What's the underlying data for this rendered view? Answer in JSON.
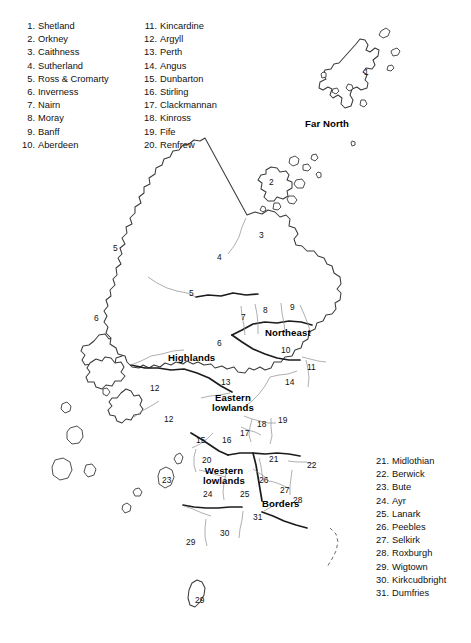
{
  "figure": {
    "background_color": "#ffffff",
    "outline_color": "#3a3a3a",
    "region_boundary_color": "#1a1a1a",
    "county_boundary_color": "#8c8c8c",
    "text_color": "#111111"
  },
  "legend": {
    "col1": [
      {
        "num": "1.",
        "name": "Shetland"
      },
      {
        "num": "2.",
        "name": "Orkney"
      },
      {
        "num": "3.",
        "name": "Caithness"
      },
      {
        "num": "4.",
        "name": "Sutherland"
      },
      {
        "num": "5.",
        "name": "Ross & Cromarty"
      },
      {
        "num": "6.",
        "name": "Inverness"
      },
      {
        "num": "7.",
        "name": "Nairn"
      },
      {
        "num": "8.",
        "name": "Moray"
      },
      {
        "num": "9.",
        "name": "Banff"
      },
      {
        "num": "10.",
        "name": "Aberdeen"
      }
    ],
    "col2": [
      {
        "num": "11.",
        "name": "Kincardine"
      },
      {
        "num": "12.",
        "name": "Argyll"
      },
      {
        "num": "13.",
        "name": "Perth"
      },
      {
        "num": "14.",
        "name": "Angus"
      },
      {
        "num": "15.",
        "name": "Dunbarton"
      },
      {
        "num": "16.",
        "name": "Stirling"
      },
      {
        "num": "17.",
        "name": "Clackmannan"
      },
      {
        "num": "18.",
        "name": "Kinross"
      },
      {
        "num": "19.",
        "name": "Fife"
      },
      {
        "num": "20.",
        "name": "Renfrew"
      }
    ],
    "col3": [
      {
        "num": "21.",
        "name": "Midlothian"
      },
      {
        "num": "22.",
        "name": "Berwick"
      },
      {
        "num": "23.",
        "name": "Bute"
      },
      {
        "num": "24.",
        "name": "Ayr"
      },
      {
        "num": "25.",
        "name": "Lanark"
      },
      {
        "num": "26.",
        "name": "Peebles"
      },
      {
        "num": "27.",
        "name": "Selkirk"
      },
      {
        "num": "28.",
        "name": "Roxburgh"
      },
      {
        "num": "29.",
        "name": "Wigtown"
      },
      {
        "num": "30.",
        "name": "Kirkcudbright"
      },
      {
        "num": "31.",
        "name": "Dumfries"
      }
    ]
  },
  "regions": [
    {
      "name": "Far North",
      "x": 305,
      "y": 118,
      "multiline": false
    },
    {
      "name": "Highlands",
      "x": 168,
      "y": 352,
      "multiline": false
    },
    {
      "name": "Northeast",
      "x": 265,
      "y": 327,
      "multiline": false
    },
    {
      "name": "Eastern\nlowlands",
      "x": 212,
      "y": 393,
      "multiline": true
    },
    {
      "name": "Western\nlowlands",
      "x": 203,
      "y": 466,
      "multiline": true
    },
    {
      "name": "Borders",
      "x": 262,
      "y": 498,
      "multiline": false
    }
  ],
  "county_markers": [
    {
      "num": "1",
      "x": 369,
      "y": 73
    },
    {
      "num": "2",
      "x": 274,
      "y": 183
    },
    {
      "num": "3",
      "x": 264,
      "y": 236
    },
    {
      "num": "4",
      "x": 222,
      "y": 258
    },
    {
      "num": "5",
      "x": 118,
      "y": 249
    },
    {
      "num": "5",
      "x": 194,
      "y": 294
    },
    {
      "num": "6",
      "x": 99,
      "y": 319
    },
    {
      "num": "6",
      "x": 222,
      "y": 344
    },
    {
      "num": "7",
      "x": 246,
      "y": 318
    },
    {
      "num": "8",
      "x": 268,
      "y": 311
    },
    {
      "num": "9",
      "x": 295,
      "y": 308
    },
    {
      "num": "10",
      "x": 286,
      "y": 351
    },
    {
      "num": "11",
      "x": 312,
      "y": 368
    },
    {
      "num": "12",
      "x": 155,
      "y": 389
    },
    {
      "num": "12",
      "x": 169,
      "y": 420
    },
    {
      "num": "13",
      "x": 226,
      "y": 383
    },
    {
      "num": "14",
      "x": 290,
      "y": 383
    },
    {
      "num": "15",
      "x": 201,
      "y": 441
    },
    {
      "num": "16",
      "x": 227,
      "y": 441
    },
    {
      "num": "17",
      "x": 245,
      "y": 434
    },
    {
      "num": "18",
      "x": 262,
      "y": 425
    },
    {
      "num": "19",
      "x": 283,
      "y": 421
    },
    {
      "num": "20",
      "x": 207,
      "y": 461
    },
    {
      "num": "21",
      "x": 274,
      "y": 460
    },
    {
      "num": "22",
      "x": 312,
      "y": 466
    },
    {
      "num": "23",
      "x": 167,
      "y": 481
    },
    {
      "num": "24",
      "x": 208,
      "y": 495
    },
    {
      "num": "25",
      "x": 245,
      "y": 495
    },
    {
      "num": "26",
      "x": 264,
      "y": 481
    },
    {
      "num": "27",
      "x": 285,
      "y": 491
    },
    {
      "num": "28",
      "x": 298,
      "y": 501
    },
    {
      "num": "29",
      "x": 191,
      "y": 543
    },
    {
      "num": "29",
      "x": 200,
      "y": 601
    },
    {
      "num": "30",
      "x": 225,
      "y": 534
    },
    {
      "num": "31",
      "x": 258,
      "y": 518
    }
  ]
}
